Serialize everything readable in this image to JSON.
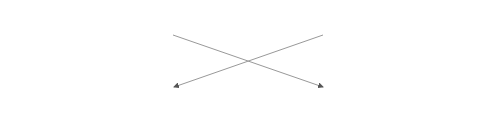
{
  "diagram": {
    "shape_color": "#333333",
    "line_color": "#999999",
    "top_row": [
      "c",
      "c",
      "s",
      "s",
      "c",
      "s",
      "s",
      "s",
      "s",
      "s",
      "s",
      "s",
      "s",
      "s",
      "s",
      "s",
      "s",
      "s",
      "c",
      "s",
      "c",
      "c",
      "c",
      "s",
      "s",
      "s",
      "s",
      "s",
      "s",
      "s",
      "c",
      "s",
      "s",
      "s",
      "s",
      "s",
      "s",
      "s",
      "s",
      "c",
      "c",
      "s"
    ],
    "folds": [
      {
        "label": "Fold 1",
        "items": [
          "c",
          "s",
          "s",
          "s",
          "c",
          "s",
          "s",
          "s"
        ]
      },
      {
        "label": "Fold 2",
        "items": [
          "s",
          "c",
          "s",
          "s",
          "s",
          "c",
          "s",
          "s"
        ]
      },
      {
        "label": "Fold 3",
        "items": [
          "c",
          "c",
          "s",
          "s",
          "s",
          "s",
          "s",
          "s"
        ]
      },
      {
        "label": "Fold 4",
        "items": [
          "s",
          "s",
          "s",
          "c",
          "s",
          "s",
          "c",
          "s"
        ]
      },
      {
        "label": "Fold 5",
        "items": [
          "s",
          "s",
          "s",
          "s",
          "s",
          "c",
          "s",
          "c"
        ]
      }
    ]
  }
}
